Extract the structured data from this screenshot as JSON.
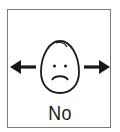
{
  "card": {
    "label": "No",
    "icons": {
      "face": "sad-face-icon",
      "left_arrow": "arrow-left-icon",
      "right_arrow": "arrow-right-icon"
    },
    "colors": {
      "stroke": "#1a1a1a",
      "border": "#7a7a7a",
      "background": "#ffffff"
    }
  }
}
